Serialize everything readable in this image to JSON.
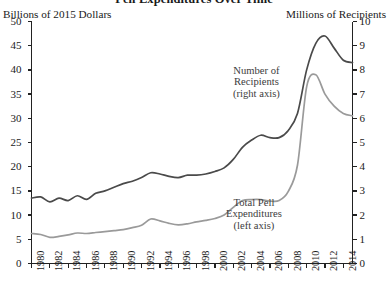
{
  "chart_data": {
    "type": "line",
    "title": "Pell Expenditures Over Time",
    "xlabel": "",
    "ylabel": "Billions of 2015 Dollars",
    "ylabel_right": "Millions of Recipients",
    "grid": false,
    "legend_position": "inline-annotations",
    "xlim": [
      1980,
      2015
    ],
    "ylim": [
      0,
      50
    ],
    "ylim_right": [
      0,
      10
    ],
    "yticks": [
      0,
      5,
      10,
      15,
      20,
      25,
      30,
      35,
      40,
      45,
      50
    ],
    "yticks_right": [
      0,
      1,
      2,
      3,
      4,
      5,
      6,
      7,
      8,
      9,
      10
    ],
    "xticks": [
      1980,
      1982,
      1984,
      1986,
      1988,
      1990,
      1992,
      1994,
      1996,
      1998,
      2000,
      2002,
      2004,
      2006,
      2008,
      2010,
      2012,
      2014
    ],
    "x": [
      1980,
      1981,
      1982,
      1983,
      1984,
      1985,
      1986,
      1987,
      1988,
      1989,
      1990,
      1991,
      1992,
      1993,
      1994,
      1995,
      1996,
      1997,
      1998,
      1999,
      2000,
      2001,
      2002,
      2003,
      2004,
      2005,
      2006,
      2007,
      2008,
      2009,
      2010,
      2011,
      2012,
      2013,
      2014,
      2015
    ],
    "series": [
      {
        "name": "Number of Recipients",
        "axis": "right",
        "units": "Millions of Recipients",
        "color": "#4a4a4a",
        "annotation": "Number of\nRecipients\n(right axis)",
        "values": [
          2.7,
          2.75,
          2.55,
          2.7,
          2.6,
          2.8,
          2.65,
          2.9,
          3.0,
          3.15,
          3.3,
          3.4,
          3.55,
          3.75,
          3.7,
          3.6,
          3.55,
          3.65,
          3.65,
          3.7,
          3.8,
          3.95,
          4.3,
          4.8,
          5.1,
          5.3,
          5.2,
          5.2,
          5.5,
          6.2,
          8.0,
          9.1,
          9.4,
          8.9,
          8.4,
          8.3
        ]
      },
      {
        "name": "Total Pell Expenditures",
        "axis": "left",
        "units": "Billions of 2015 Dollars",
        "color": "#9a9a9a",
        "annotation": "Total Pell\nExpenditures\n(left axis)",
        "values": [
          6.2,
          6.0,
          5.4,
          5.6,
          5.9,
          6.3,
          6.2,
          6.4,
          6.6,
          6.8,
          7.0,
          7.4,
          7.9,
          9.2,
          8.8,
          8.3,
          8.0,
          8.2,
          8.6,
          8.9,
          9.3,
          10.0,
          11.6,
          13.0,
          13.2,
          13.2,
          12.9,
          13.0,
          14.9,
          20.3,
          36.5,
          39.0,
          35.0,
          32.5,
          31.0,
          30.5
        ]
      }
    ]
  },
  "annotations": {
    "recipients": {
      "line1": "Number of",
      "line2": "Recipients",
      "line3": "(right axis)"
    },
    "expenditures": {
      "line1": "Total Pell",
      "line2": "Expenditures",
      "line3": "(left axis)"
    }
  }
}
